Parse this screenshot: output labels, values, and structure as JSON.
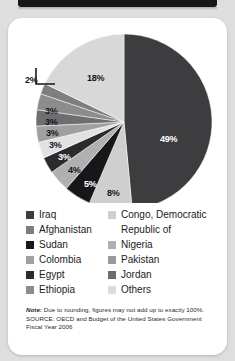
{
  "page": {
    "background_color": "#dedede",
    "card_color": "#ffffff",
    "top_bar_color": "#17171a"
  },
  "chart_data": {
    "type": "pie",
    "title": "",
    "subtitle": "",
    "xlabel": "",
    "ylabel": "",
    "legend_position": "bottom",
    "start_angle_deg": 0,
    "direction": "clockwise",
    "categories": [
      "Iraq",
      "Congo, Democratic Republic of",
      "Sudan",
      "Nigeria",
      "Egypt",
      "Pakistan",
      "Colombia",
      "Jordan",
      "Ethiopia",
      "Afghanistan",
      "Others"
    ],
    "values": [
      49,
      8,
      5,
      4,
      3,
      3,
      3,
      3,
      3,
      2,
      18
    ],
    "value_labels": [
      "49%",
      "8%",
      "5%",
      "4%",
      "3%",
      "3%",
      "3%",
      "3%",
      "3%",
      "2%",
      "18%"
    ],
    "colors": [
      "#3d3d40",
      "#cfcfcf",
      "#17171a",
      "#b0b0b0",
      "#2b2b2e",
      "#e2e2e2",
      "#a0a0a0",
      "#6e6e71",
      "#8c8c8c",
      "#7e7e80",
      "#d8d8d8"
    ],
    "units": "percent of total",
    "annotations": [
      {
        "label": "2%",
        "has_leader_line": true,
        "slice": "Afghanistan"
      }
    ],
    "notes": [
      "Note: Due to rounding, figures may not add up to exactly 100%.",
      "SOURCE: OECD and Budget of the United States Government",
      "Fiscal Year 2006"
    ]
  },
  "pie_labels": [
    {
      "text": "49%",
      "x": 152,
      "y": 116,
      "tone": "dark"
    },
    {
      "text": "18%",
      "x": 79,
      "y": 55,
      "tone": "light"
    },
    {
      "text": "8%",
      "x": 99,
      "y": 170,
      "tone": "light"
    },
    {
      "text": "5%",
      "x": 76,
      "y": 161,
      "tone": "dark"
    },
    {
      "text": "4%",
      "x": 60,
      "y": 147,
      "tone": "light"
    },
    {
      "text": "3%",
      "x": 50,
      "y": 134,
      "tone": "dark"
    },
    {
      "text": "3%",
      "x": 41,
      "y": 122,
      "tone": "light"
    },
    {
      "text": "3%",
      "x": 38,
      "y": 110,
      "tone": "light"
    },
    {
      "text": "3%",
      "x": 37,
      "y": 99,
      "tone": "light"
    },
    {
      "text": "3%",
      "x": 37,
      "y": 88,
      "tone": "light"
    },
    {
      "text": "2%",
      "x": 17,
      "y": 57,
      "tone": "light"
    }
  ],
  "legend": {
    "left_column": [
      {
        "label": "Iraq",
        "color": "#3d3d40",
        "swatch": true
      },
      {
        "label": "Afghanistan",
        "color": "#7e7e80",
        "swatch": true
      },
      {
        "label": "Sudan",
        "color": "#17171a",
        "swatch": true
      },
      {
        "label": "Colombia",
        "color": "#a0a0a0",
        "swatch": true
      },
      {
        "label": "Egypt",
        "color": "#2b2b2e",
        "swatch": true
      },
      {
        "label": "Ethiopia",
        "color": "#8c8c8c",
        "swatch": true
      }
    ],
    "right_column": [
      {
        "label": "Congo, Democratic",
        "color": "#cfcfcf",
        "swatch": true
      },
      {
        "label": "Republic of",
        "color": "",
        "swatch": false
      },
      {
        "label": "Nigeria",
        "color": "#b0b0b0",
        "swatch": true
      },
      {
        "label": "Pakistan",
        "color": "#9a9a9a",
        "swatch": true
      },
      {
        "label": "Jordan",
        "color": "#6e6e71",
        "swatch": true
      },
      {
        "label": "Others",
        "color": "#dcdcdc",
        "swatch": true
      }
    ]
  },
  "notes": {
    "line1_prefix": "Note:",
    "line1_rest": " Due to rounding, figures may not add up to exactly 100%.",
    "line2": "SOURCE: OECD and Budget of the United States Government",
    "line3": "Fiscal Year 2006"
  }
}
